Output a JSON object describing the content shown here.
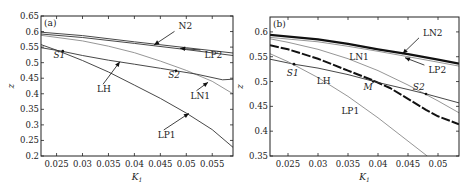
{
  "chart_data": [
    {
      "type": "line",
      "panel_label": "(a)",
      "xlabel": "K1",
      "ylabel": "z",
      "xlim": [
        0.022,
        0.059
      ],
      "ylim": [
        0.2,
        0.65
      ],
      "xticks": [
        0.025,
        0.03,
        0.035,
        0.04,
        0.045,
        0.05,
        0.055
      ],
      "xtick_labels": [
        "0.025",
        "0.03",
        "0.035",
        "0.04",
        "0.045",
        "0.05",
        "0.055"
      ],
      "yticks": [
        0.2,
        0.25,
        0.3,
        0.35,
        0.4,
        0.45,
        0.5,
        0.55,
        0.6,
        0.65
      ],
      "ytick_labels": [
        "0.2",
        "0.25",
        "0.3",
        "0.35",
        "0.4",
        "0.45",
        "0.5",
        "0.55",
        "0.6",
        "0.65"
      ],
      "grid": false,
      "series": [
        {
          "name": "N2",
          "style": "thin-dark",
          "x": [
            0.022,
            0.03,
            0.04,
            0.05,
            0.059
          ],
          "y": [
            0.598,
            0.587,
            0.567,
            0.548,
            0.531
          ]
        },
        {
          "name": "LP2",
          "style": "thin-dark",
          "x": [
            0.022,
            0.03,
            0.04,
            0.05,
            0.059
          ],
          "y": [
            0.592,
            0.581,
            0.562,
            0.542,
            0.523
          ]
        },
        {
          "name": "LN1",
          "style": "thin-gray",
          "x": [
            0.022,
            0.03,
            0.035,
            0.04,
            0.045,
            0.05,
            0.055,
            0.059
          ],
          "y": [
            0.588,
            0.57,
            0.553,
            0.532,
            0.505,
            0.475,
            0.44,
            0.4
          ]
        },
        {
          "name": "LH",
          "style": "thin-dark",
          "x": [
            0.022,
            0.026,
            0.03,
            0.035,
            0.04,
            0.045,
            0.048,
            0.052,
            0.057,
            0.059
          ],
          "y": [
            0.548,
            0.537,
            0.523,
            0.508,
            0.495,
            0.482,
            0.474,
            0.463,
            0.445,
            0.447
          ]
        },
        {
          "name": "LP1",
          "style": "thin-dark",
          "x": [
            0.022,
            0.025,
            0.03,
            0.035,
            0.04,
            0.045,
            0.05,
            0.055,
            0.059
          ],
          "y": [
            0.558,
            0.54,
            0.507,
            0.47,
            0.428,
            0.385,
            0.338,
            0.285,
            0.228
          ]
        }
      ],
      "points": [
        {
          "name": "S1",
          "x": 0.0262,
          "y": 0.537
        },
        {
          "name": "S2",
          "x": 0.048,
          "y": 0.474
        }
      ],
      "annotations": [
        {
          "text": "N2",
          "x": 0.0485,
          "y": 0.607,
          "arrow_to": [
            0.0438,
            0.557
          ],
          "italic": false
        },
        {
          "text": "LP2",
          "x": 0.0535,
          "y": 0.515,
          "arrow_to": [
            0.0488,
            0.546
          ],
          "italic": false
        },
        {
          "text": "LH",
          "x": 0.0328,
          "y": 0.405,
          "arrow_to": [
            0.0372,
            0.503
          ],
          "italic": false
        },
        {
          "text": "LN1",
          "x": 0.0508,
          "y": 0.384,
          "arrow_to": [
            0.0542,
            0.437
          ],
          "italic": false
        },
        {
          "text": "LP1",
          "x": 0.0445,
          "y": 0.258,
          "arrow_to": [
            0.0505,
            0.337
          ],
          "italic": false
        },
        {
          "text": "S1",
          "x": 0.0244,
          "y": 0.514,
          "italic": true
        },
        {
          "text": "S2",
          "x": 0.0465,
          "y": 0.452,
          "italic": true
        }
      ]
    },
    {
      "type": "line",
      "panel_label": "(b)",
      "xlabel": "K1",
      "ylabel": "z",
      "xlim": [
        0.022,
        0.0535
      ],
      "ylim": [
        0.35,
        0.63
      ],
      "xticks": [
        0.025,
        0.03,
        0.035,
        0.04,
        0.045,
        0.05
      ],
      "xtick_labels": [
        "0.025",
        "0.03",
        "0.035",
        "0.04",
        "0.045",
        "0.05"
      ],
      "yticks": [
        0.35,
        0.4,
        0.45,
        0.5,
        0.55,
        0.6
      ],
      "ytick_labels": [
        "0.35",
        "0.4",
        "0.45",
        "0.5",
        "0.55",
        "0.6"
      ],
      "grid": false,
      "series": [
        {
          "name": "LN2",
          "style": "thick-dark",
          "x": [
            0.022,
            0.03,
            0.035,
            0.04,
            0.045,
            0.05,
            0.0535
          ],
          "y": [
            0.594,
            0.585,
            0.576,
            0.565,
            0.555,
            0.544,
            0.536
          ]
        },
        {
          "name": "LP2",
          "style": "thin-gray",
          "x": [
            0.022,
            0.03,
            0.035,
            0.04,
            0.045,
            0.05,
            0.0535
          ],
          "y": [
            0.589,
            0.58,
            0.571,
            0.561,
            0.55,
            0.539,
            0.531
          ]
        },
        {
          "name": "LN1",
          "style": "thin-gray",
          "x": [
            0.022,
            0.025,
            0.03,
            0.035,
            0.04,
            0.045,
            0.05,
            0.0535
          ],
          "y": [
            0.586,
            0.579,
            0.565,
            0.546,
            0.522,
            0.493,
            0.461,
            0.437
          ]
        },
        {
          "name": "M-branch",
          "style": "thick-dashed",
          "x": [
            0.022,
            0.025,
            0.03,
            0.035,
            0.039,
            0.042,
            0.045,
            0.048,
            0.05,
            0.0535
          ],
          "y": [
            0.573,
            0.565,
            0.546,
            0.522,
            0.503,
            0.487,
            0.465,
            0.443,
            0.43,
            0.414
          ]
        },
        {
          "name": "LH",
          "style": "thin-dark",
          "x": [
            0.022,
            0.026,
            0.03,
            0.035,
            0.04,
            0.045,
            0.048,
            0.0535
          ],
          "y": [
            0.545,
            0.535,
            0.527,
            0.514,
            0.498,
            0.484,
            0.475,
            0.457
          ]
        },
        {
          "name": "LP1",
          "style": "thin-gray",
          "x": [
            0.022,
            0.025,
            0.03,
            0.035,
            0.04,
            0.045,
            0.0482
          ],
          "y": [
            0.556,
            0.54,
            0.508,
            0.47,
            0.427,
            0.38,
            0.35
          ]
        }
      ],
      "points": [
        {
          "name": "S1",
          "x": 0.026,
          "y": 0.535
        },
        {
          "name": "M",
          "x": 0.0392,
          "y": 0.5
        },
        {
          "name": "S2",
          "x": 0.048,
          "y": 0.475
        }
      ],
      "annotations": [
        {
          "text": "LN2",
          "x": 0.0475,
          "y": 0.592,
          "arrow_to": [
            0.0441,
            0.556
          ],
          "italic": false
        },
        {
          "text": "LP2",
          "x": 0.0484,
          "y": 0.517,
          "arrow_to": [
            0.0445,
            0.548
          ],
          "italic": false
        },
        {
          "text": "LN1",
          "x": 0.0352,
          "y": 0.543,
          "italic": false
        },
        {
          "text": "LH",
          "x": 0.0298,
          "y": 0.496,
          "italic": false
        },
        {
          "text": "LP1",
          "x": 0.0339,
          "y": 0.435,
          "italic": false
        },
        {
          "text": "S1",
          "x": 0.0248,
          "y": 0.512,
          "italic": true
        },
        {
          "text": "M",
          "x": 0.0376,
          "y": 0.482,
          "italic": true
        },
        {
          "text": "S2",
          "x": 0.0458,
          "y": 0.483,
          "italic": true
        }
      ]
    }
  ],
  "layout": {
    "panels": [
      {
        "left": 41,
        "right": 233,
        "top": 16,
        "bottom": 156
      },
      {
        "left": 270,
        "right": 459,
        "top": 17,
        "bottom": 156
      }
    ],
    "colors": {
      "axis": "#222222",
      "dark": "#333333",
      "gray": "#8a8a8a",
      "thick": "#111111"
    }
  }
}
